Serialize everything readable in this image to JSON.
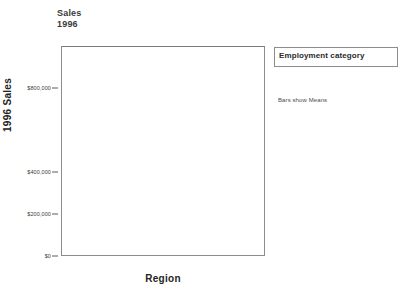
{
  "chart_data": {
    "type": "bar",
    "title": "Sales",
    "subtitle": "1996",
    "xlabel": "Region",
    "ylabel": "1996 Sales",
    "categories": [
      "East",
      "Central",
      "West"
    ],
    "series": [
      {
        "name": "Associate",
        "color": "#5e5e5e",
        "values": [
          290000,
          310000,
          340000
        ]
      },
      {
        "name": "Junior",
        "color": "#b6b6b6",
        "values": [
          860000,
          780000,
          920000
        ]
      }
    ],
    "ylim": [
      0,
      1000000
    ],
    "ytick_values": [
      0,
      200000,
      400000,
      800000
    ],
    "ytick_labels": [
      "$0",
      "$200,000",
      "$400,000",
      "$800,000"
    ],
    "grid": false,
    "legend_position": "right",
    "legend_title": "Employment category",
    "annotation": "Bars show Means"
  },
  "legend": {
    "title": "Employment category",
    "items": [
      {
        "label": "Associate",
        "color": "#5e5e5e"
      },
      {
        "label": "Junior",
        "color": "#b6b6b6"
      }
    ]
  },
  "footnote": "Bars show Means"
}
